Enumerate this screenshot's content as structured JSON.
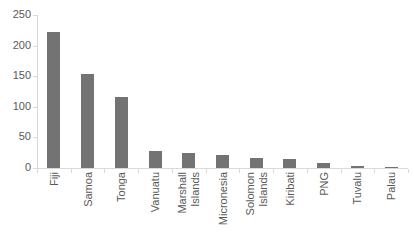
{
  "chart_data": {
    "type": "bar",
    "title": "",
    "subtitle": "",
    "xlabel": "",
    "ylabel": "",
    "ylim": [
      0,
      250
    ],
    "yticks": [
      0,
      50,
      100,
      150,
      200,
      250
    ],
    "ytick_labels": [
      "0",
      "50",
      "100",
      "150",
      "200",
      "250"
    ],
    "grid": false,
    "legend": false,
    "legend_position": "none",
    "bar_color": "#737373",
    "axis_color": "#d9d9d9",
    "text_color": "#595959",
    "categories": [
      "Fiji",
      "Samoa",
      "Tonga",
      "Vanuatu",
      "Marshall Islands",
      "Micronesia",
      "Solomon Islands",
      "Kiribati",
      "PNG",
      "Tuvalu",
      "Palau"
    ],
    "category_label_lines": [
      [
        "Fiji"
      ],
      [
        "Samoa"
      ],
      [
        "Tonga"
      ],
      [
        "Vanuatu"
      ],
      [
        "Marshall",
        "Islands"
      ],
      [
        "Micronesia"
      ],
      [
        "Solomon",
        "Islands"
      ],
      [
        "Kiribati"
      ],
      [
        "PNG"
      ],
      [
        "Tuvalu"
      ],
      [
        "Palau"
      ]
    ],
    "values": [
      222,
      153,
      116,
      27,
      25,
      22,
      17,
      15,
      8,
      3,
      1
    ]
  }
}
